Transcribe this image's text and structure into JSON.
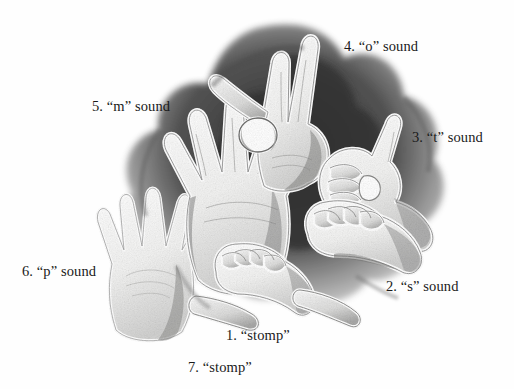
{
  "figure": {
    "background_color": "#fefefe",
    "text_color": "#1a1a1a",
    "drawing": {
      "medium": "graphite-pencil-sketch",
      "description": "Cluster of seven overlapping human hands rendered as light silhouettes with white outlines against dark charcoal shading",
      "palette": {
        "paper": "#fefefe",
        "hand_fill": "#f4f4f3",
        "hand_outline": "#ffffff",
        "mid_shadow": "#8d8d8d",
        "deep_shadow": "#3a3a3a",
        "darkest": "#1f1f1f"
      }
    },
    "labels": [
      {
        "id": "label-1",
        "number": "1.",
        "term": "“stomp”",
        "text": "1. “stomp”",
        "icon": "fist-hand-icon"
      },
      {
        "id": "label-2",
        "number": "2.",
        "term": "“s” sound",
        "text": "2. “s” sound",
        "icon": "fist-hand-icon"
      },
      {
        "id": "label-3",
        "number": "3.",
        "term": "“t” sound",
        "text": "3. “t” sound",
        "icon": "thumb-between-fingers-hand-icon"
      },
      {
        "id": "label-4",
        "number": "4.",
        "term": "“o” sound",
        "text": "4. “o” sound",
        "icon": "circle-fingers-hand-icon"
      },
      {
        "id": "label-5",
        "number": "5.",
        "term": "“m” sound",
        "text": "5. “m” sound",
        "icon": "open-spread-hand-icon"
      },
      {
        "id": "label-6",
        "number": "6.",
        "term": "“p” sound",
        "text": "6. “p” sound",
        "icon": "open-spread-hand-icon"
      },
      {
        "id": "label-7",
        "number": "7.",
        "term": "“stomp”",
        "text": "7. “stomp”",
        "icon": "fist-hand-icon"
      }
    ]
  }
}
